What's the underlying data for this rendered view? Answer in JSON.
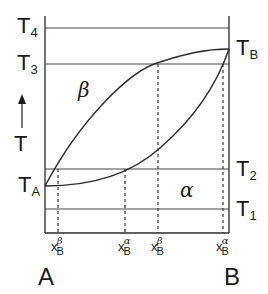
{
  "diagram": {
    "type": "binary phase diagram (lens)",
    "phases": {
      "upper": "β",
      "lower": "α"
    },
    "y_axis": {
      "label": "T",
      "arrow": "up-arrow"
    },
    "left_labels": [
      "T4",
      "T3",
      "TA"
    ],
    "right_labels": [
      "TB",
      "T2",
      "T1"
    ],
    "temperatures": {
      "T4": {
        "main": "T",
        "sub": "4"
      },
      "T3": {
        "main": "T",
        "sub": "3"
      },
      "TA": {
        "main": "T",
        "sub": "A"
      },
      "TB": {
        "main": "T",
        "sub": "B"
      },
      "T2": {
        "main": "T",
        "sub": "2"
      },
      "T1": {
        "main": "T",
        "sub": "1"
      }
    },
    "compositions": [
      {
        "main": "x",
        "sub": "B",
        "sup": "β"
      },
      {
        "main": "x",
        "sub": "B",
        "sup": "α"
      },
      {
        "main": "x",
        "sub": "B",
        "sup": "β"
      },
      {
        "main": "x",
        "sub": "B",
        "sup": "α"
      }
    ],
    "x_axis_ends": {
      "left": "A",
      "right": "B"
    },
    "colors": {
      "line": "#2a2a2a",
      "text": "#1a1a1a"
    }
  }
}
